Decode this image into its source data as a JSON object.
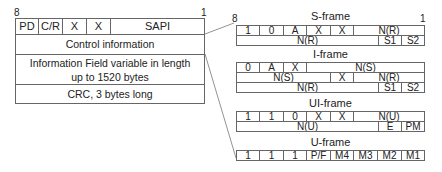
{
  "main_frame": {
    "bit_left": "8",
    "bit_right": "1",
    "header_cells": [
      "PD",
      "C/R",
      "X",
      "X",
      "SAPI"
    ],
    "rows": [
      "Control information",
      "Information Field variable in length up to 1520 bytes",
      "CRC, 3 bytes long"
    ]
  },
  "control_frames": {
    "bit_left": "8",
    "bit_right": "1",
    "s_frame": {
      "title": "S-frame",
      "row1": [
        "1",
        "0",
        "A",
        "X",
        "X",
        "N(R)"
      ],
      "row2": [
        "N(R)",
        "S1",
        "S2"
      ]
    },
    "i_frame": {
      "title": "I-frame",
      "row1": [
        "0",
        "A",
        "X",
        "N(S)"
      ],
      "row2": [
        "N(S)",
        "X",
        "N(R)"
      ],
      "row3": [
        "N(R)",
        "S1",
        "S2"
      ]
    },
    "ui_frame": {
      "title": "UI-frame",
      "row1": [
        "1",
        "1",
        "0",
        "X",
        "X",
        "N(U)"
      ],
      "row2": [
        "N(U)",
        "E",
        "PM"
      ]
    },
    "u_frame": {
      "title": "U-frame",
      "row1": [
        "1",
        "1",
        "1",
        "P/F",
        "M4",
        "M3",
        "M2",
        "M1"
      ]
    }
  },
  "colors": {
    "line": "#666666",
    "text": "#222222",
    "background": "#ffffff"
  }
}
